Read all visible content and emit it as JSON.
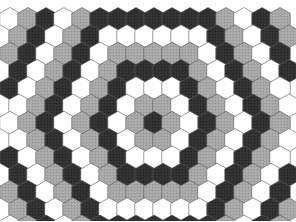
{
  "figure": {
    "name": "concentric-hexagon-ring-tiling",
    "width": 296,
    "height": 221,
    "background_color": "#ffffff"
  },
  "chart_data": {
    "type": "heatmap",
    "title": "",
    "subtitle": "",
    "xlabel": "",
    "ylabel": "",
    "grid": false,
    "legend_position": "none",
    "tiling": {
      "shape": "hexagon",
      "orientation": "pointy-top",
      "columns": 16,
      "rows": 13,
      "hex_width": 20.5,
      "hex_height": 23.0,
      "column_pitch": 18.0,
      "row_pitch": 17.3,
      "origin_x": 10.0,
      "origin_y": 19.0,
      "row_offset_x": 9.0
    },
    "ring_sequence": {
      "description": "Colour assigned by hexagonal ring distance from the centre cell; index 0 is the centre.",
      "period": 3,
      "colors_by_ring_mod": [
        "dark",
        "grey",
        "white"
      ],
      "ring_index_start": 0
    },
    "palette": {
      "dark": "#2f2f2f",
      "grey": "#a6a6a6",
      "white": "#ffffff",
      "outline": "#5a5a5a"
    },
    "rings": [
      {
        "ring": 0,
        "color_name": "dark",
        "color": "#2f2f2f",
        "cell_count": 1
      },
      {
        "ring": 1,
        "color_name": "grey",
        "color": "#a6a6a6",
        "cell_count": 6
      },
      {
        "ring": 2,
        "color_name": "white",
        "color": "#ffffff",
        "cell_count": 12
      },
      {
        "ring": 3,
        "color_name": "dark",
        "color": "#2f2f2f",
        "cell_count": 18
      },
      {
        "ring": 4,
        "color_name": "grey",
        "color": "#a6a6a6",
        "cell_count": 24
      },
      {
        "ring": 5,
        "color_name": "white",
        "color": "#ffffff",
        "cell_count": 30
      },
      {
        "ring": 6,
        "color_name": "dark",
        "color": "#2f2f2f",
        "cell_count": 36
      },
      {
        "ring": 7,
        "color_name": "grey",
        "color": "#a6a6a6",
        "cell_count": 42
      },
      {
        "ring": 8,
        "color_name": "white",
        "color": "#ffffff",
        "cell_count": 48
      },
      {
        "ring": 9,
        "color_name": "dark",
        "color": "#2f2f2f",
        "cell_count": 54
      }
    ],
    "center_cell": {
      "col": 8,
      "row": 6,
      "color_name": "dark",
      "color": "#2f2f2f"
    },
    "texture": {
      "dark_has_speckle": true,
      "grey_has_speckle": true,
      "white_has_speckle": false
    }
  }
}
